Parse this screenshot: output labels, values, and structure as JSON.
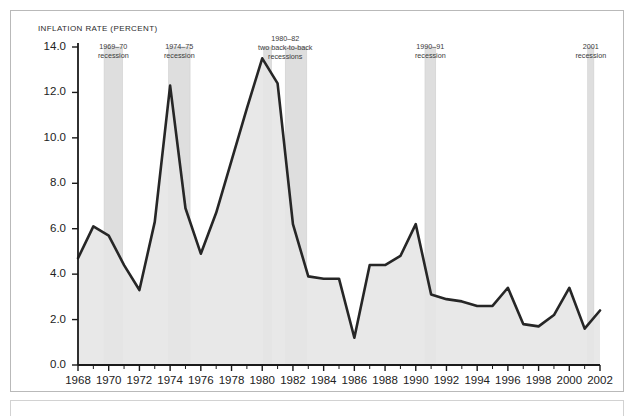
{
  "chart_title": "INFLATION RATE (PERCENT)",
  "axis": {
    "y_ticks": [
      "0.0",
      "2.0",
      "4.0",
      "6.0",
      "8.0",
      "10.0",
      "12.0",
      "14.0"
    ],
    "x_ticks": [
      "1968",
      "1970",
      "1972",
      "1974",
      "1976",
      "1978",
      "1980",
      "1982",
      "1984",
      "1986",
      "1988",
      "1990",
      "1992",
      "1994",
      "1996",
      "1998",
      "2000",
      "2002"
    ]
  },
  "colors": {
    "line": "#262626",
    "fill": "#e6e6e6",
    "band": "#dedede",
    "band_stroke": "#cfcfcf",
    "axis": "#1a1a1a",
    "panel_border": "#b9b9b9",
    "text": "#222222"
  },
  "annotations": [
    {
      "id": "recession-1969-70",
      "line1": "1969–70",
      "line2": "recession",
      "line3": ""
    },
    {
      "id": "recession-1974-75",
      "line1": "1974–75",
      "line2": "recession",
      "line3": ""
    },
    {
      "id": "recession-1980-82",
      "line1": "1980–82",
      "line2": "two back-to-back",
      "line3": "recessions"
    },
    {
      "id": "recession-1990-91",
      "line1": "1990–91",
      "line2": "recession",
      "line3": ""
    },
    {
      "id": "recession-2001",
      "line1": "2001",
      "line2": "recession",
      "line3": ""
    }
  ],
  "chart_data": {
    "type": "area",
    "title": "INFLATION RATE (PERCENT)",
    "xlabel": "",
    "ylabel": "INFLATION RATE (PERCENT)",
    "xlim": [
      1968,
      2002
    ],
    "ylim": [
      0.0,
      14.0
    ],
    "grid": false,
    "legend": "none",
    "x": [
      1968,
      1969,
      1970,
      1971,
      1972,
      1973,
      1974,
      1975,
      1976,
      1977,
      1978,
      1979,
      1980,
      1981,
      1982,
      1983,
      1984,
      1985,
      1986,
      1987,
      1988,
      1989,
      1990,
      1991,
      1992,
      1993,
      1994,
      1995,
      1996,
      1997,
      1998,
      1999,
      2000,
      2001,
      2002
    ],
    "values": [
      4.7,
      6.1,
      5.7,
      4.4,
      3.3,
      6.3,
      12.3,
      6.9,
      4.9,
      6.7,
      9.0,
      11.3,
      13.5,
      12.4,
      6.2,
      3.9,
      3.8,
      3.8,
      1.2,
      4.4,
      4.4,
      4.8,
      6.2,
      3.1,
      2.9,
      2.8,
      2.6,
      2.6,
      3.4,
      1.8,
      1.7,
      2.2,
      3.4,
      1.6,
      2.4
    ],
    "series": [
      {
        "name": "Inflation rate (percent)",
        "values": [
          4.7,
          6.1,
          5.7,
          4.4,
          3.3,
          6.3,
          12.3,
          6.9,
          4.9,
          6.7,
          9.0,
          11.3,
          13.5,
          12.4,
          6.2,
          3.9,
          3.8,
          3.8,
          1.2,
          4.4,
          4.4,
          4.8,
          6.2,
          3.1,
          2.9,
          2.8,
          2.6,
          2.6,
          3.4,
          1.8,
          1.7,
          2.2,
          3.4,
          1.6,
          2.4
        ]
      }
    ],
    "shaded_bands": [
      {
        "label": "1969–70 recession",
        "start": 1969.7,
        "end": 1970.9
      },
      {
        "label": "1974–75 recession",
        "start": 1973.9,
        "end": 1975.3
      },
      {
        "label": "1980 recession",
        "start": 1980.1,
        "end": 1980.6
      },
      {
        "label": "1981–82 recession",
        "start": 1981.5,
        "end": 1982.9
      },
      {
        "label": "1990–91 recession",
        "start": 1990.6,
        "end": 1991.3
      },
      {
        "label": "2001 recession",
        "start": 2001.2,
        "end": 2001.6
      }
    ]
  }
}
